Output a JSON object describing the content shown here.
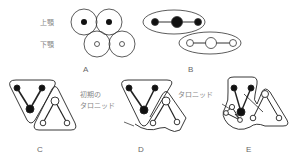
{
  "labels": {
    "upper_jaw": "上顎",
    "lower_jaw": "下顎",
    "early_taronid": "初期の",
    "early_taronid_2": "タロニッド",
    "taronid": "タロニッド"
  },
  "panels": [
    {
      "id": "A",
      "label": "A"
    },
    {
      "id": "B",
      "label": "B"
    },
    {
      "id": "C",
      "label": "C"
    },
    {
      "id": "D",
      "label": "D"
    },
    {
      "id": "E",
      "label": "E"
    }
  ],
  "colors": {
    "stroke": "#333333",
    "filled": "#111111",
    "text": "#777777"
  }
}
